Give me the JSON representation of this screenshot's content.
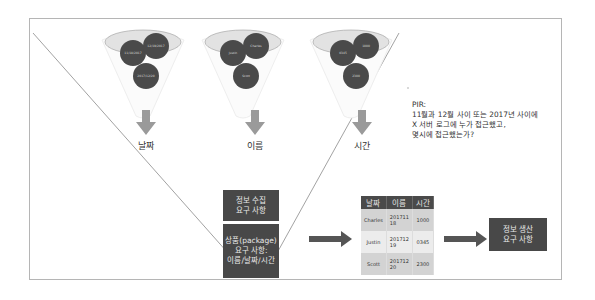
{
  "diagram": {
    "funnels": [
      {
        "id": "date",
        "label": "날짜",
        "circles": [
          "11/18/2017",
          "12/19/2017",
          "2017/12/20"
        ]
      },
      {
        "id": "name",
        "label": "이름",
        "circles": [
          "Justin",
          "Charles",
          "Scott"
        ]
      },
      {
        "id": "time",
        "label": "시간",
        "circles": [
          "0345",
          "1000",
          "2300"
        ]
      }
    ],
    "pir": {
      "title": "PIR:",
      "lines": [
        "11월과 12월  사이 또는 2017년 사이에",
        "X 서버 로그에 누가 접근했고,",
        "몇시에 접근했는가?"
      ]
    },
    "boxes": {
      "collection_requirements": [
        "정보 수집",
        "요구 사항"
      ],
      "package_requirements": [
        "상품(package)",
        "요구 사항:",
        "이름/날짜/시간"
      ],
      "production_requirements": [
        "정보 생산",
        "요구 사항"
      ]
    },
    "table": {
      "headers": [
        "날짜",
        "이름",
        "시간"
      ],
      "rows": [
        {
          "name": "Charles",
          "date_line1": "201711",
          "date_line2": "18",
          "time": "1000"
        },
        {
          "name": "Justin",
          "date_line1": "201712",
          "date_line2": "19",
          "time": "0345"
        },
        {
          "name": "Scott",
          "date_line1": "201712",
          "date_line2": "20",
          "time": "2300"
        }
      ]
    },
    "colors": {
      "dark_box": "#484848",
      "circle": "#4a4a4a",
      "arrow": "#9a9a9a",
      "dark_arrow": "#555555",
      "ellipse": "#e2e2e2",
      "frame_border": "#b5b5b5"
    }
  }
}
